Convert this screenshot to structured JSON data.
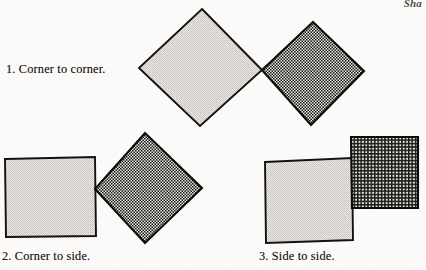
{
  "page": {
    "running_head": "Sha",
    "background_color": "#fbfaf8",
    "ink_color": "#17150f"
  },
  "figure": {
    "title_implied": "Three ways two squares can touch",
    "groups": [
      {
        "id": "group-1",
        "caption": "1.  Corner to corner.",
        "relation": "corner-to-corner",
        "shapes": [
          {
            "name": "light-square-1",
            "fill": "halftone-light",
            "fill_color": "#d8d6d2",
            "rotation_deg": 45,
            "points": "202,9 262,70 200,126 139,68"
          },
          {
            "name": "dark-square-1",
            "fill": "checker-dark",
            "fill_color": "#4a4a4a",
            "rotation_deg": 45,
            "points": "313,22 364,71 311,125 262,70"
          }
        ]
      },
      {
        "id": "group-2",
        "caption": "2.  Corner to side.",
        "relation": "corner-to-side",
        "shapes": [
          {
            "name": "light-square-2",
            "fill": "halftone-light",
            "fill_color": "#d8d6d2",
            "rotation_deg": 1,
            "points": "5,159 95,157 96,236 6,237"
          },
          {
            "name": "dark-square-2",
            "fill": "checker-dark",
            "fill_color": "#4a4a4a",
            "rotation_deg": 45,
            "points": "145,133 202,188 145,243 95,189"
          }
        ]
      },
      {
        "id": "group-3",
        "caption": "3.  Side to side.",
        "relation": "side-to-side",
        "shapes": [
          {
            "name": "light-square-3",
            "fill": "halftone-light",
            "fill_color": "#d8d6d2",
            "rotation_deg": 1,
            "points": "265,162 352,158 353,240 266,243"
          },
          {
            "name": "dark-square-3",
            "fill": "grid-dark",
            "fill_color": "#555555",
            "rotation_deg": 0,
            "points": "351,137 418,137 418,208 352,208"
          }
        ]
      }
    ]
  }
}
